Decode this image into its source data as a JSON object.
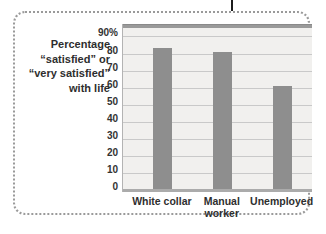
{
  "figure": {
    "title_lines": [
      "Percentage",
      "“satisfied” or",
      "“very satisfied”",
      "with life"
    ]
  },
  "chart_data": {
    "type": "bar",
    "title": "Percentage “satisfied” or “very satisfied” with life",
    "categories": [
      "White collar",
      "Manual worker",
      "Unemployed"
    ],
    "values": [
      83,
      81,
      61
    ],
    "xlabel": "",
    "ylabel": "Percentage “satisfied” or “very satisfied” with life",
    "ylim": [
      0,
      97
    ],
    "yticks": {
      "values": [
        90,
        80,
        70,
        60,
        50,
        40,
        30,
        20,
        10,
        0
      ],
      "labels": [
        "90%",
        "80",
        "70",
        "60",
        "50",
        "40",
        "30",
        "20",
        "10",
        "0"
      ]
    },
    "grid": true,
    "legend": "none",
    "colors": {
      "bar": "#8e8e8e",
      "plot_background": "#f1f0ee",
      "gridline": "#c9c9c9",
      "top_band": "#9a9a9a",
      "bottom_band": "#ababab",
      "axis_line": "#b3b3b3",
      "text": "#2e2e2e",
      "dotted_border": "#9a9a9a",
      "column_rule": "#1c1c1c"
    }
  }
}
